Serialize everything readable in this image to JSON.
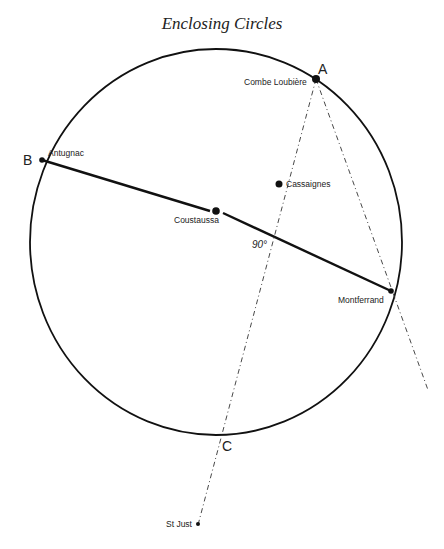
{
  "title": "Enclosing Circles",
  "points": {
    "A": {
      "letter": "A",
      "name": "Combe Loubière"
    },
    "B": {
      "letter": "B",
      "name": "Antugnac"
    },
    "C": {
      "letter": "C"
    },
    "coustaussa": {
      "name": "Coustaussa"
    },
    "cassaignes": {
      "name": "Cassaignes"
    },
    "montferrand": {
      "name": "Montferrand"
    },
    "stjust": {
      "name": "St Just"
    }
  },
  "angle_label": "90°"
}
